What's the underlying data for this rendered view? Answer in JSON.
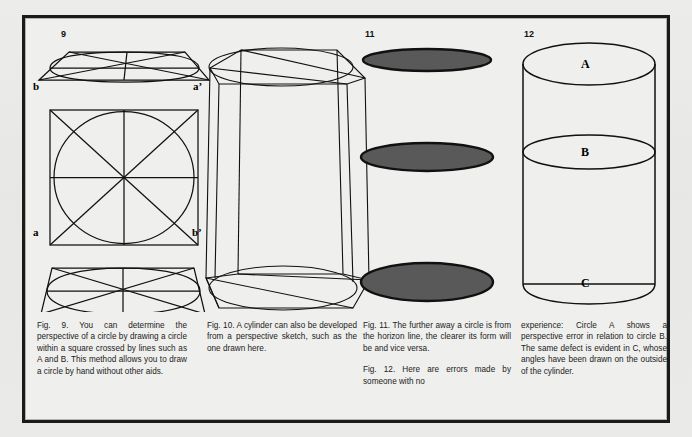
{
  "page": {
    "background_color": "#e9e9e7",
    "frame_color": "#1a1a1a",
    "paper_color": "#efefed"
  },
  "figures": [
    {
      "id": "fig9",
      "number": "9",
      "type": "circle-in-square-perspective",
      "corner_labels": {
        "top_left": "b",
        "top_right": "a’",
        "bottom_left": "a",
        "bottom_right": "b’"
      },
      "description": "A square containing an inscribed circle with vertical, horizontal and diagonal construction lines, shown flat in the middle and in perspective as trapezoids above and below."
    },
    {
      "id": "fig10",
      "number": "",
      "type": "cylinder-in-perspective-box",
      "description": "A cylinder developed inside a perspective box frame, with top and bottom ellipses inscribed in perspective squares."
    },
    {
      "id": "fig11",
      "number": "11",
      "type": "three-filled-ellipses",
      "fill_color": "#595959",
      "stroke_color": "#111111",
      "ellipses": [
        {
          "label": "top",
          "rx": 66,
          "ry": 11
        },
        {
          "label": "middle",
          "rx": 66,
          "ry": 14
        },
        {
          "label": "bottom",
          "rx": 66,
          "ry": 19
        }
      ],
      "description": "Three dark grey ellipses becoming progressively rounder from top to bottom."
    },
    {
      "id": "fig12",
      "number": "12",
      "type": "cylinder-with-labelled-ellipses",
      "ellipse_labels": [
        "A",
        "B",
        "C"
      ],
      "description": "A cylinder with three ellipses labelled A, B and C showing perspective errors."
    }
  ],
  "captions": [
    {
      "id": "caption-fig9",
      "paragraphs": [
        "Fig. 9. You can determine the perspective of a circle by drawing a circle within a square crossed by lines such as A and B. This method allows you to draw a circle by hand without other aids."
      ]
    },
    {
      "id": "caption-fig10",
      "paragraphs": [
        "Fig. 10. A cylinder can also be developed from a perspective sketch, such as the one drawn here."
      ]
    },
    {
      "id": "caption-fig11",
      "paragraphs": [
        "Fig. 11. The further away a circle is from the horizon line, the clearer its form will be and vice versa.",
        "Fig. 12. Here are errors made by someone with no"
      ]
    },
    {
      "id": "caption-fig12",
      "paragraphs": [
        "experience: Circle A shows a perspective error in relation to circle B. The same defect is evident in C, whose angles have been drawn on the outside of the cylinder."
      ]
    }
  ]
}
